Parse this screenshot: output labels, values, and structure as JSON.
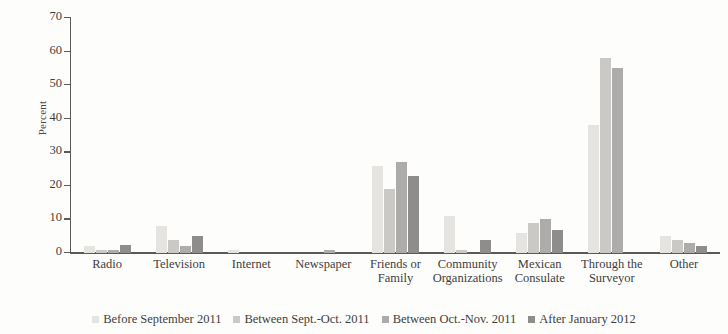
{
  "chart_data": {
    "type": "bar",
    "title": "",
    "xlabel": "",
    "ylabel": "Percent",
    "ylim": [
      0,
      70
    ],
    "yticks": [
      0,
      10,
      20,
      30,
      40,
      50,
      60,
      70
    ],
    "grid": false,
    "legend_position": "bottom",
    "categories": [
      "Radio",
      "Television",
      "Internet",
      "Newspaper",
      "Friends or Family",
      "Community Organizations",
      "Mexican Consulate",
      "Through the Surveyor",
      "Other"
    ],
    "category_lines": [
      [
        "Radio"
      ],
      [
        "Television"
      ],
      [
        "Internet"
      ],
      [
        "Newspaper"
      ],
      [
        "Friends or",
        "Family"
      ],
      [
        "Community",
        "Organizations"
      ],
      [
        "Mexican",
        "Consulate"
      ],
      [
        "Through the",
        "Surveyor"
      ],
      [
        "Other"
      ]
    ],
    "series": [
      {
        "name": "Before September 2011",
        "color": "#e6e4e1",
        "values": [
          2,
          8,
          1,
          0,
          26,
          11,
          6,
          38,
          5
        ]
      },
      {
        "name": "Between Sept.-Oct. 2011",
        "color": "#cbc9c6",
        "values": [
          1,
          4,
          0,
          0,
          19,
          1,
          9,
          58,
          4
        ]
      },
      {
        "name": "Between Oct.-Nov. 2011",
        "color": "#aeacaa",
        "values": [
          1,
          2,
          0,
          1,
          27,
          0,
          10,
          55,
          3
        ]
      },
      {
        "name": "After January 2012",
        "color": "#8e8d8c",
        "values": [
          2.5,
          5,
          0,
          0,
          23,
          4,
          7,
          0,
          2
        ]
      }
    ]
  }
}
